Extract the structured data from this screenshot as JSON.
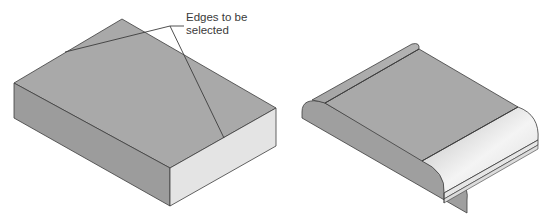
{
  "figure": {
    "left_panel": {
      "description": "Rectangular block before fillet",
      "callout": {
        "line1": "Edges to be",
        "line2": "selected"
      }
    },
    "right_panel": {
      "description": "Block after fillet applied to two selected edges"
    }
  },
  "colors": {
    "top_face": "#a9a9a9",
    "left_face": "#9c9c9c",
    "right_face": "#e4e4e4",
    "edge": "#3c3c3c",
    "fillet_highlight": "#f2f2f2"
  }
}
